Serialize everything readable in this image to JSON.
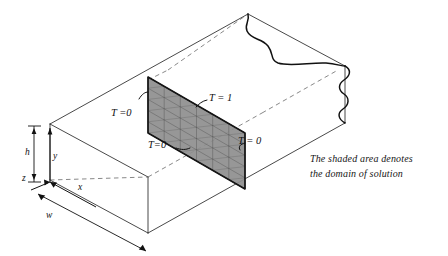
{
  "figure": {
    "caption_line1": "The shaded area denotes",
    "caption_line2": "the domain of solution"
  },
  "boundary_conditions": [
    {
      "id": "left",
      "label": "T =0",
      "edge": "left vertical edge of shaded plane"
    },
    {
      "id": "top",
      "label": "T = 1",
      "edge": "top edge of shaded plane"
    },
    {
      "id": "bottom",
      "label": "T=0",
      "edge": "bottom edge of shaded plane"
    },
    {
      "id": "right",
      "label": "T = 0",
      "edge": "right vertical edge of shaded plane"
    }
  ],
  "axes": [
    {
      "id": "x",
      "label": "x"
    },
    {
      "id": "y",
      "label": "y"
    },
    {
      "id": "z",
      "label": "z"
    }
  ],
  "dimensions": [
    {
      "id": "h",
      "label": "h",
      "meaning": "duct height"
    },
    {
      "id": "w",
      "label": "w",
      "meaning": "duct width"
    }
  ],
  "colors": {
    "shade_fill": "#8e8e8e",
    "line": "#1a1a1a",
    "hidden_line": "#6a6a6a",
    "background": "#ffffff"
  }
}
